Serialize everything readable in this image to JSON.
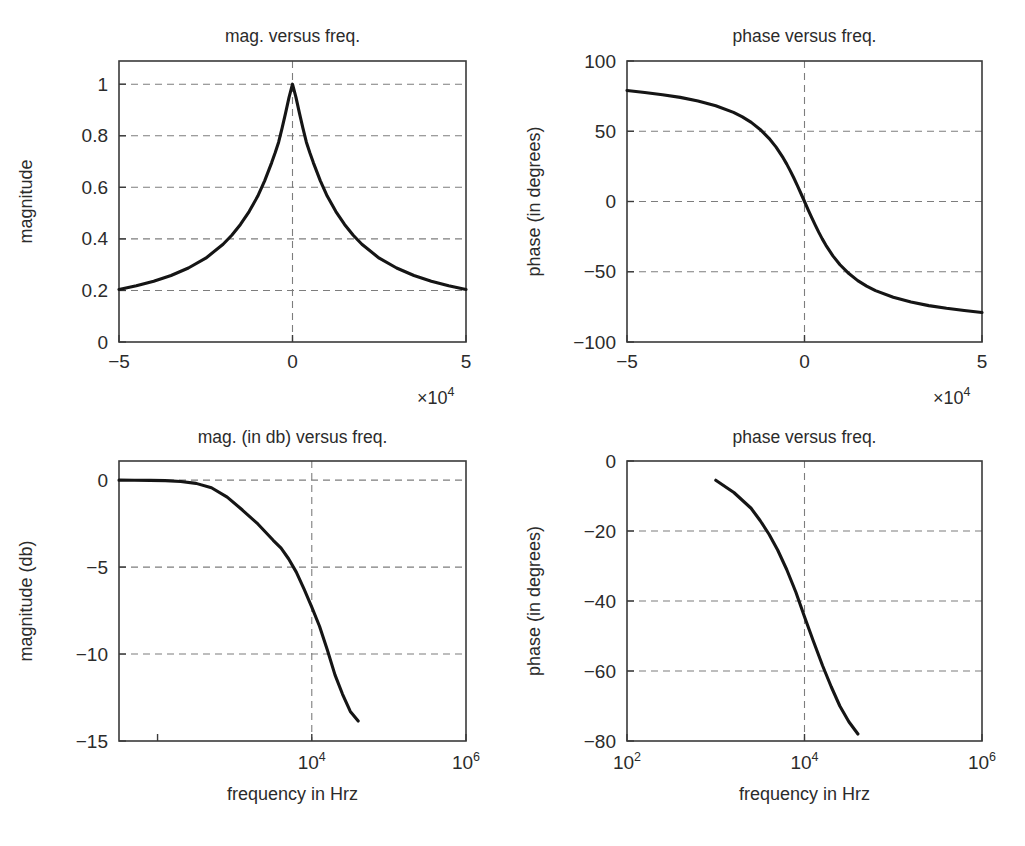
{
  "figure": {
    "width": 1025,
    "height": 846,
    "background": "#ffffff",
    "curve_color": "#151515",
    "axis_color": "#3a3a3a",
    "grid_color": "#7d7d7d"
  },
  "chart_data": [
    {
      "id": "mag-linear",
      "type": "line",
      "title": "mag. versus freq.",
      "xlabel": "",
      "ylabel": "magnitude",
      "xscale": "linear",
      "yscale": "linear",
      "xlim": [
        -50000,
        50000
      ],
      "ylim": [
        0,
        1.09
      ],
      "x_exponent_label": "×10",
      "x_exponent_power": "4",
      "xticks": [
        -50000,
        0,
        50000
      ],
      "xticklabels": [
        "−5",
        "0",
        "5"
      ],
      "yticks": [
        0,
        0.2,
        0.4,
        0.6,
        0.8,
        1
      ],
      "yticklabels": [
        "0",
        "0.2",
        "0.4",
        "0.6",
        "0.8",
        "1"
      ],
      "grid": "dashed-horizontal-plus-x-zero",
      "grid_x": [
        0
      ],
      "grid_y": [
        0.2,
        0.4,
        0.6,
        0.8,
        1
      ],
      "legend": "none",
      "series": [
        {
          "name": "magnitude",
          "x": [
            -50000,
            -45000,
            -40000,
            -35000,
            -30000,
            -25000,
            -20000,
            -17500,
            -15000,
            -12500,
            -10000,
            -8000,
            -6000,
            -5000,
            -4000,
            -3000,
            -2000,
            -1000,
            0,
            1000,
            2000,
            3000,
            4000,
            5000,
            6000,
            8000,
            10000,
            12500,
            15000,
            17500,
            20000,
            25000,
            30000,
            35000,
            40000,
            45000,
            50000
          ],
          "y": [
            0.204,
            0.218,
            0.236,
            0.258,
            0.287,
            0.325,
            0.379,
            0.414,
            0.456,
            0.506,
            0.566,
            0.626,
            0.696,
            0.734,
            0.775,
            0.83,
            0.888,
            0.949,
            1.0,
            0.949,
            0.888,
            0.83,
            0.775,
            0.734,
            0.696,
            0.626,
            0.566,
            0.506,
            0.456,
            0.414,
            0.379,
            0.325,
            0.287,
            0.258,
            0.236,
            0.218,
            0.204
          ]
        }
      ]
    },
    {
      "id": "phase-linear",
      "type": "line",
      "title": "phase versus freq.",
      "xlabel": "",
      "ylabel": "phase (in degrees)",
      "xscale": "linear",
      "yscale": "linear",
      "xlim": [
        -50000,
        50000
      ],
      "ylim": [
        -100,
        100
      ],
      "x_exponent_label": "×10",
      "x_exponent_power": "4",
      "xticks": [
        -50000,
        0,
        50000
      ],
      "xticklabels": [
        "−5",
        "0",
        "5"
      ],
      "yticks": [
        -100,
        -50,
        0,
        50,
        100
      ],
      "yticklabels": [
        "−100",
        "−50",
        "0",
        "50",
        "100"
      ],
      "grid": "dashed-horizontal-plus-x-zero",
      "grid_x": [
        0
      ],
      "grid_y": [
        -50,
        0,
        50
      ],
      "legend": "none",
      "series": [
        {
          "name": "phase",
          "x": [
            -50000,
            -45000,
            -40000,
            -35000,
            -30000,
            -25000,
            -20000,
            -17500,
            -15000,
            -12500,
            -10000,
            -8000,
            -6000,
            -5000,
            -4000,
            -3000,
            -2000,
            -1000,
            0,
            1000,
            2000,
            3000,
            4000,
            5000,
            6000,
            8000,
            10000,
            12500,
            15000,
            17500,
            20000,
            25000,
            30000,
            35000,
            40000,
            45000,
            50000
          ],
          "y": [
            79.0,
            77.6,
            76.0,
            74.1,
            71.6,
            68.2,
            63.4,
            60.2,
            56.3,
            51.3,
            45.0,
            38.7,
            31.0,
            26.6,
            21.8,
            16.7,
            11.3,
            5.7,
            0.0,
            -5.7,
            -11.3,
            -16.7,
            -21.8,
            -26.6,
            -31.0,
            -38.7,
            -45.0,
            -51.3,
            -56.3,
            -60.2,
            -63.4,
            -68.2,
            -71.6,
            -74.1,
            -76.0,
            -77.6,
            -79.0
          ]
        }
      ]
    },
    {
      "id": "mag-db",
      "type": "line",
      "title": "mag. (in db) versus freq.",
      "xlabel": "frequency in Hrz",
      "ylabel": "magnitude (db)",
      "xscale": "log",
      "yscale": "linear",
      "xlim": [
        31.62,
        1000000
      ],
      "ylim": [
        -15,
        1.1
      ],
      "xticks": [
        100,
        10000,
        1000000
      ],
      "xticklabels": [
        "10",
        "10",
        "10"
      ],
      "xtick_exponents": [
        "2",
        "4",
        "6"
      ],
      "xticklabels_shown": [
        false,
        true,
        true
      ],
      "yticks": [
        -15,
        -10,
        -5,
        0
      ],
      "yticklabels": [
        "−15",
        "−10",
        "−5",
        "0"
      ],
      "grid": "dashed-horizontal-plus-x-decade",
      "grid_x": [
        10000
      ],
      "grid_y": [
        -10,
        -5,
        0
      ],
      "legend": "none",
      "series": [
        {
          "name": "magnitude-db",
          "x": [
            31.62,
            50,
            80,
            126,
            200,
            316,
            500,
            800,
            1260,
            2000,
            3160,
            4000,
            5000,
            6300,
            8000,
            10000,
            12600,
            16000,
            20000,
            25000,
            31600,
            40000
          ],
          "y": [
            -0.002,
            -0.005,
            -0.012,
            -0.03,
            -0.075,
            -0.187,
            -0.44,
            -0.98,
            -1.72,
            -2.52,
            -3.46,
            -3.91,
            -4.52,
            -5.29,
            -6.3,
            -7.3,
            -8.4,
            -9.8,
            -11.2,
            -12.3,
            -13.3,
            -13.85
          ]
        }
      ]
    },
    {
      "id": "phase-db",
      "type": "line",
      "title": "phase versus freq.",
      "xlabel": "frequency in Hrz",
      "ylabel": "phase (in degrees)",
      "xscale": "log",
      "yscale": "linear",
      "xlim": [
        100,
        1000000
      ],
      "ylim": [
        -80,
        0
      ],
      "xticks": [
        100,
        10000,
        1000000
      ],
      "xticklabels": [
        "10",
        "10",
        "10"
      ],
      "xtick_exponents": [
        "2",
        "4",
        "6"
      ],
      "yticks": [
        -80,
        -60,
        -40,
        -20,
        0
      ],
      "yticklabels": [
        "−80",
        "−60",
        "−40",
        "−20",
        "0"
      ],
      "grid": "dashed-horizontal-plus-x-decade",
      "grid_x": [
        10000
      ],
      "grid_y": [
        -60,
        -40,
        -20
      ],
      "legend": "none",
      "series": [
        {
          "name": "phase",
          "x": [
            1000,
            1600,
            2500,
            3160,
            4000,
            5000,
            6300,
            8000,
            10000,
            12600,
            16000,
            20000,
            25000,
            31600,
            40000
          ],
          "y": [
            -5.5,
            -9.0,
            -13.5,
            -17.0,
            -21.0,
            -25.5,
            -31.0,
            -37.5,
            -44.5,
            -51.5,
            -58.5,
            -64.5,
            -70.0,
            -74.5,
            -78.0
          ]
        }
      ]
    }
  ]
}
